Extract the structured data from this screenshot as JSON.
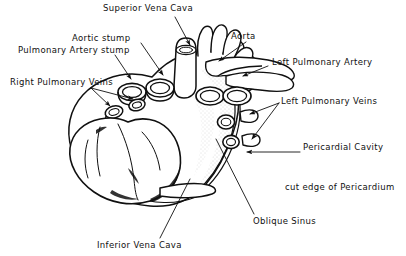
{
  "figure": {
    "background_color": "#ffffff",
    "ink_color": "#101010",
    "width": 406,
    "height": 256
  },
  "labels": [
    {
      "id": "superior-vena-cava",
      "text": "Superior Vena Cava",
      "x": 103,
      "y": 3,
      "leader": "line-with-arrow",
      "target_x": 193,
      "target_y": 48
    },
    {
      "id": "aortic-stump",
      "text": "Aortic stump",
      "x": 72,
      "y": 33,
      "leader": "line-with-arrow",
      "target_x": 168,
      "target_y": 72
    },
    {
      "id": "pulmonary-artery-stump",
      "text": "Pulmonary Artery stump",
      "x": 18,
      "y": 45,
      "leader": "line-with-arrow",
      "target_x": 137,
      "target_y": 77
    },
    {
      "id": "right-pulmonary-veins",
      "text": "Right Pulmonary Veins",
      "x": 10,
      "y": 77,
      "leader": "forked-lines",
      "target_x": 139,
      "target_y": 100
    },
    {
      "id": "aorta",
      "text": "Aorta",
      "x": 231,
      "y": 31,
      "leader": "line-with-arrow",
      "target_x": 214,
      "target_y": 62
    },
    {
      "id": "left-pulmonary-artery",
      "text": "Left Pulmonary Artery",
      "x": 256,
      "y": 57,
      "leader": "line-with-arrow",
      "target_x": 238,
      "target_y": 75
    },
    {
      "id": "left-pulmonary-veins",
      "text": "Left Pulmonary Veins",
      "x": 271,
      "y": 96,
      "leader": "forked-lines",
      "target_x": 238,
      "target_y": 104
    },
    {
      "id": "pericardial-cavity",
      "text": "Pericardial Cavity",
      "x": 285,
      "y": 142,
      "leader": "line-with-arrow",
      "target_x": 242,
      "target_y": 153
    },
    {
      "id": "cut-edge-of-pericardium",
      "text": "cut edge of Pericardium",
      "x": 285,
      "y": 182,
      "leader": "none",
      "target_x": null,
      "target_y": null
    },
    {
      "id": "oblique-sinus",
      "text": "Oblique Sinus",
      "x": 253,
      "y": 216,
      "leader": "plain-line",
      "target_x": 218,
      "target_y": 141
    },
    {
      "id": "inferior-vena-cava",
      "text": "Inferior Vena Cava",
      "x": 97,
      "y": 240,
      "leader": "plain-line",
      "target_x": 183,
      "target_y": 181
    }
  ]
}
